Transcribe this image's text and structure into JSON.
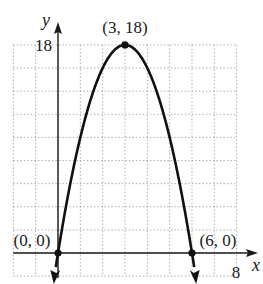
{
  "chart_data": {
    "type": "line",
    "title": "",
    "xlabel": "x",
    "ylabel": "y",
    "xlim": [
      -2,
      8
    ],
    "ylim": [
      -2,
      18
    ],
    "grid": true,
    "grid_x_step": 1,
    "grid_y_step": 2,
    "legend": "none",
    "tick_labels": {
      "x": [
        "8"
      ],
      "y": [
        "18"
      ]
    },
    "series": [
      {
        "name": "y = -2x^2 + 12x",
        "x": [
          -0.1,
          0,
          0.5,
          1,
          1.5,
          2,
          2.5,
          3,
          3.5,
          4,
          4.5,
          5,
          5.5,
          6,
          6.1
        ],
        "y": [
          -1.22,
          0,
          5.5,
          10,
          13.5,
          16,
          17.5,
          18,
          17.5,
          16,
          13.5,
          10,
          5.5,
          0,
          -1.22
        ]
      }
    ],
    "points": [
      {
        "x": 0,
        "y": 0,
        "label": "(0, 0)"
      },
      {
        "x": 3,
        "y": 18,
        "label": "(3, 18)"
      },
      {
        "x": 6,
        "y": 0,
        "label": "(6, 0)"
      }
    ],
    "annotations": [
      "(0, 0)",
      "(3, 18)",
      "(6, 0)"
    ]
  },
  "labels": {
    "x_axis": "x",
    "y_axis": "y",
    "x_tick": "8",
    "y_tick": "18",
    "origin_point": "(0, 0)",
    "vertex_point": "(3, 18)",
    "root_point": "(6, 0)"
  },
  "colors": {
    "curve": "#111111",
    "axis": "#1a1a1a",
    "grid": "#9a9a9a"
  }
}
